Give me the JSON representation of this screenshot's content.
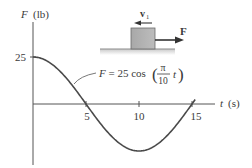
{
  "figure": {
    "y_axis_label_var": "F",
    "y_axis_label_unit": "(lb)",
    "x_axis_label_var": "t",
    "x_axis_label_unit": "(s)",
    "y_tick_label": "25",
    "x_tick_labels": [
      "5",
      "10",
      "15"
    ],
    "equation": {
      "lhs": "F = 25 cos",
      "numerator": "π",
      "denominator": "10",
      "var": "t"
    },
    "block": {
      "velocity_label": "v",
      "velocity_subscript": "1",
      "force_label": "F"
    },
    "colors": {
      "curve": "#4a4a4a",
      "axis": "#555555",
      "block_fill": "#b3b3b3",
      "block_stroke": "#6a6a6a",
      "arrow": "#333333",
      "ground": "#8c8c8c"
    }
  },
  "chart_data": {
    "type": "line",
    "title": "",
    "xlabel": "t (s)",
    "ylabel": "F (lb)",
    "function": "F = 25 cos(π t / 10)",
    "x": [
      0,
      1,
      2,
      3,
      4,
      5,
      6,
      7,
      8,
      9,
      10,
      11,
      12,
      13,
      14,
      15
    ],
    "series": [
      {
        "name": "F = 25 cos(πt/10)",
        "values": [
          25.0,
          23.78,
          20.23,
          14.69,
          7.73,
          0.0,
          -7.73,
          -14.69,
          -20.23,
          -23.78,
          -25.0,
          -23.78,
          -20.23,
          -14.69,
          -7.73,
          0.0
        ]
      }
    ],
    "x_ticks": [
      5,
      10,
      15
    ],
    "y_ticks": [
      25
    ],
    "xlim": [
      0,
      17
    ],
    "ylim": [
      -25,
      30
    ],
    "grid": false,
    "annotations": [
      "F = 25 cos(π/10 t)",
      "v1 (block velocity, leftward)",
      "F (applied force, rightward)"
    ]
  }
}
